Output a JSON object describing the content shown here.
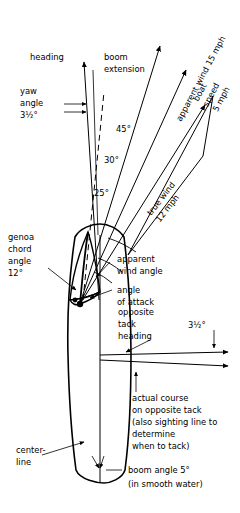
{
  "figure": {
    "type": "sailing-points-diagram",
    "title": "",
    "background": "#ffffff",
    "ink": "#000000"
  },
  "labels": {
    "heading": "heading",
    "boom_extension_line1": "boom",
    "boom_extension_line2": "extension",
    "yaw_angle_line1": "yaw",
    "yaw_angle_line2": "angle",
    "yaw_angle_value": "3½°",
    "angle_45": "45°",
    "angle_30": "30°",
    "angle_25": "25°",
    "apparent_wind_speed": "apparent wind 15 mph",
    "boat_speed_line1": "boat",
    "boat_speed_line2": "speed",
    "boat_speed_line3": "5 mph",
    "true_wind_line1": "true wind",
    "true_wind_line2": "12 mph",
    "genoa_chord_line1": "genoa",
    "genoa_chord_line2": "chord",
    "genoa_chord_line3": "angle",
    "genoa_chord_value": "12°",
    "apparent_wind_angle_line1": "apparent",
    "apparent_wind_angle_line2": "wind angle",
    "angle_of_attack_line1": "angle",
    "angle_of_attack_line2": "of attack",
    "opposite_tack_line1": "opposite",
    "opposite_tack_line2": "tack",
    "opposite_tack_line3": "heading",
    "opposite_tack_angle": "3½°",
    "actual_course_line1": "actual course",
    "actual_course_line2": "on opposite tack",
    "actual_course_line3": "(also sighting line to",
    "actual_course_line4": "determine",
    "actual_course_line5": "when to tack)",
    "centerline_line1": "center-",
    "centerline_line2": "line",
    "boom_angle_line1": "boom angle 5°",
    "boom_angle_line2": "(in smooth water)"
  },
  "values": {
    "yaw_angle_deg": 3.5,
    "genoa_chord_angle_deg": 12,
    "boom_angle_deg": 5,
    "opposite_tack_offset_deg": 3.5,
    "apparent_wind_angle_deg": 25,
    "close_hauled_course_deg": 30,
    "true_wind_angle_deg": 45,
    "apparent_wind_speed_mph": 15,
    "boat_speed_mph": 5,
    "true_wind_speed_mph": 12
  }
}
